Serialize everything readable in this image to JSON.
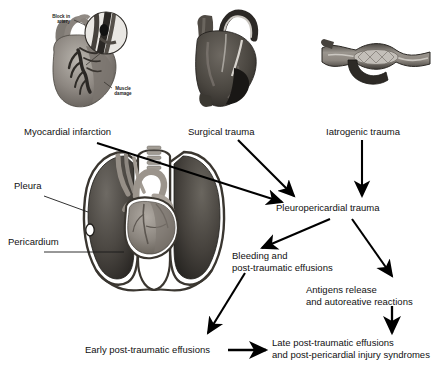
{
  "diagram": {
    "background_color": "#ffffff",
    "text_color": "#111111",
    "arrow_color": "#000000"
  },
  "illustrations": [
    {
      "id": "myocardial-infarction-heart",
      "depicts": "heart with coronary artery blockage and infarcted muscle, with magnifier inset",
      "caption": "Myocardial infarction",
      "annotations": [
        {
          "id": "block-in-artery",
          "text": "Block in\nartery"
        },
        {
          "id": "muscle-damage",
          "text": "Muscle\ndamage"
        }
      ]
    },
    {
      "id": "surgical-trauma-heart",
      "depicts": "heart with coronary artery bypass graft",
      "caption": "Surgical trauma",
      "annotations": []
    },
    {
      "id": "iatrogenic-trauma-vessel",
      "depicts": "blood vessel with balloon angioplasty / stent catheter",
      "caption": "Iatrogenic trauma",
      "annotations": []
    },
    {
      "id": "thorax-cross-section",
      "depicts": "coronal section of thorax showing lungs, heart, trachea, pleura and pericardium",
      "caption": "",
      "annotations": [
        {
          "id": "pleura",
          "text": "Pleura"
        },
        {
          "id": "pericardium",
          "text": "Pericardium"
        }
      ]
    }
  ],
  "labels": {
    "myocardial_infarction": "Myocardial infarction",
    "surgical_trauma": "Surgical trauma",
    "iatrogenic_trauma": "Iatrogenic trauma",
    "pleura": "Pleura",
    "pericardium": "Pericardium",
    "pleuropericardial_trauma": "Pleuropericardial trauma",
    "bleeding_line1": "Bleeding and",
    "bleeding_line2": "post-traumatic effusions",
    "antigens_line1": "Antigens release",
    "antigens_line2": "and autoreative reactions",
    "early_effusions": "Early post-traumatic effusions",
    "late_line1": "Late post-traumatic effusions",
    "late_line2": "and post-pericardial injury syndromes",
    "block_in_artery_line1": "Block in",
    "block_in_artery_line2": "artery",
    "muscle_damage_line1": "Muscle",
    "muscle_damage_line2": "damage"
  },
  "flow": {
    "nodes": [
      {
        "id": "myocardial-infarction",
        "label": "Myocardial infarction"
      },
      {
        "id": "surgical-trauma",
        "label": "Surgical trauma"
      },
      {
        "id": "iatrogenic-trauma",
        "label": "Iatrogenic trauma"
      },
      {
        "id": "pleuropericardial-trauma",
        "label": "Pleuropericardial trauma"
      },
      {
        "id": "bleeding-and-post-traumatic-effusions",
        "label": "Bleeding and post-traumatic effusions"
      },
      {
        "id": "antigens-release-and-autoreative-reactions",
        "label": "Antigens release and autoreative reactions"
      },
      {
        "id": "early-post-traumatic-effusions",
        "label": "Early post-traumatic effusions"
      },
      {
        "id": "late-post-traumatic-effusions",
        "label": "Late post-traumatic effusions and post-pericardial injury syndromes"
      }
    ],
    "edges": [
      {
        "from": "myocardial-infarction",
        "to": "pleuropericardial-trauma"
      },
      {
        "from": "surgical-trauma",
        "to": "pleuropericardial-trauma"
      },
      {
        "from": "iatrogenic-trauma",
        "to": "pleuropericardial-trauma"
      },
      {
        "from": "pleuropericardial-trauma",
        "to": "bleeding-and-post-traumatic-effusions"
      },
      {
        "from": "pleuropericardial-trauma",
        "to": "antigens-release-and-autoreative-reactions"
      },
      {
        "from": "bleeding-and-post-traumatic-effusions",
        "to": "early-post-traumatic-effusions"
      },
      {
        "from": "early-post-traumatic-effusions",
        "to": "late-post-traumatic-effusions"
      },
      {
        "from": "antigens-release-and-autoreative-reactions",
        "to": "late-post-traumatic-effusions"
      }
    ]
  }
}
